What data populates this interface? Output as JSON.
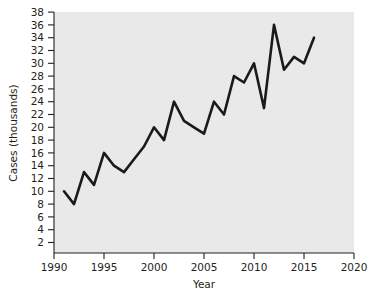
{
  "chart_data": {
    "type": "line",
    "title": "",
    "xlabel": "Year",
    "ylabel": "Cases (thousands)",
    "xlim": [
      1990,
      2020
    ],
    "ylim": [
      0,
      38
    ],
    "xticks": [
      1990,
      1995,
      2000,
      2005,
      2010,
      2015,
      2020
    ],
    "yticks": [
      2,
      4,
      6,
      8,
      10,
      12,
      14,
      16,
      18,
      20,
      22,
      24,
      26,
      28,
      30,
      32,
      34,
      36,
      38
    ],
    "xtick_labels": [
      "1990",
      "1995",
      "2000",
      "2005",
      "2010",
      "2015",
      "2020"
    ],
    "ytick_labels": [
      "2",
      "4",
      "6",
      "8",
      "10",
      "12",
      "14",
      "16",
      "18",
      "20",
      "22",
      "24",
      "26",
      "28",
      "30",
      "32",
      "34",
      "36",
      "38"
    ],
    "grid": false,
    "legend": null,
    "series": [
      {
        "name": "Cases",
        "color": "#1a1a1a",
        "x": [
          1991,
          1992,
          1993,
          1994,
          1995,
          1996,
          1997,
          1998,
          1999,
          2000,
          2001,
          2002,
          2003,
          2004,
          2005,
          2006,
          2007,
          2008,
          2009,
          2010,
          2011,
          2012,
          2013,
          2014,
          2015,
          2016
        ],
        "y": [
          10,
          8,
          13,
          11,
          16,
          14,
          13,
          15,
          17,
          20,
          18,
          24,
          21,
          20,
          19,
          24,
          22,
          28,
          27,
          30,
          23,
          36,
          29,
          31,
          30,
          34
        ]
      }
    ]
  },
  "axes": {
    "ylabel_text": "Cases (thousands)",
    "xlabel_text": "Year"
  }
}
